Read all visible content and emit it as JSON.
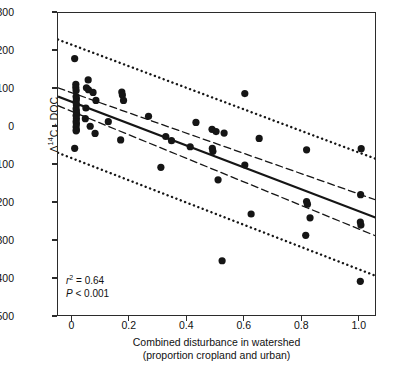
{
  "chart_data": {
    "type": "scatter",
    "title": "",
    "xlabel": "Combined disturbance in watershed (proportion cropland and urban)",
    "xlabel_line1": "Combined disturbance in watershed",
    "xlabel_line2": "(proportion cropland and urban)",
    "ylabel": "Δ14C - DOC",
    "ylabel_prefix": "Δ",
    "ylabel_sup": "14",
    "ylabel_suffix": "C - DOC",
    "xlim": [
      -0.05,
      1.06
    ],
    "ylim": [
      -500,
      300
    ],
    "xticks": [
      "0",
      "0.2",
      "0.4",
      "0.6",
      "0.8",
      "1.0"
    ],
    "xtick_values": [
      0,
      0.2,
      0.4,
      0.6,
      0.8,
      1.0
    ],
    "yticks": [
      "300",
      "200",
      "100",
      "0",
      "-100",
      "-200",
      "-300",
      "-400",
      "-500"
    ],
    "ytick_values": [
      300,
      200,
      100,
      0,
      -100,
      -200,
      -300,
      -400,
      -500
    ],
    "grid": false,
    "legend": "none",
    "marker_color": "#151515",
    "line_color": "#151515",
    "annotations": {
      "r_squared_label": "r",
      "r_squared_sup": "2",
      "r_squared_value": "= 0.64",
      "r_squared_text": "r2 = 0.64",
      "p_label": "P",
      "p_value": "< 0.001",
      "p_text": "P < 0.001"
    },
    "fit_line": {
      "name": "regression line",
      "style": "solid",
      "x": [
        -0.05,
        1.06
      ],
      "y": [
        80,
        -240
      ],
      "slope": -290,
      "intercept": 66
    },
    "confidence_band": {
      "name": "95% confidence interval",
      "style": "dashed",
      "upper": {
        "x": [
          -0.05,
          1.06
        ],
        "y": [
          103,
          -193
        ]
      },
      "lower": {
        "x": [
          -0.05,
          1.06
        ],
        "y": [
          56,
          -288
        ]
      }
    },
    "prediction_band": {
      "name": "95% prediction interval",
      "style": "dotted",
      "upper": {
        "x": [
          -0.05,
          1.06
        ],
        "y": [
          230,
          -85
        ]
      },
      "lower": {
        "x": [
          -0.05,
          1.06
        ],
        "y": [
          -68,
          -393
        ]
      }
    },
    "points": [
      {
        "x": 0.008,
        "y": 180
      },
      {
        "x": 0.055,
        "y": 124
      },
      {
        "x": 0.012,
        "y": 112
      },
      {
        "x": 0.012,
        "y": 104
      },
      {
        "x": 0.049,
        "y": 103
      },
      {
        "x": 0.056,
        "y": 98
      },
      {
        "x": 0.013,
        "y": 96
      },
      {
        "x": 0.072,
        "y": 91
      },
      {
        "x": 0.6,
        "y": 88
      },
      {
        "x": 0.172,
        "y": 92
      },
      {
        "x": 0.174,
        "y": 84
      },
      {
        "x": 0.013,
        "y": 80
      },
      {
        "x": 0.014,
        "y": 74
      },
      {
        "x": 0.082,
        "y": 70
      },
      {
        "x": 0.178,
        "y": 70
      },
      {
        "x": 0.013,
        "y": 66
      },
      {
        "x": 0.014,
        "y": 58
      },
      {
        "x": 0.047,
        "y": 50
      },
      {
        "x": 0.013,
        "y": 48
      },
      {
        "x": 0.014,
        "y": 42
      },
      {
        "x": 0.265,
        "y": 28
      },
      {
        "x": 0.015,
        "y": 34
      },
      {
        "x": 0.013,
        "y": 30
      },
      {
        "x": 0.045,
        "y": 22
      },
      {
        "x": 0.014,
        "y": 22
      },
      {
        "x": 0.125,
        "y": 14
      },
      {
        "x": 0.43,
        "y": 12
      },
      {
        "x": 0.013,
        "y": 14
      },
      {
        "x": 0.014,
        "y": 8
      },
      {
        "x": 0.062,
        "y": 2
      },
      {
        "x": 0.013,
        "y": 0
      },
      {
        "x": 0.486,
        "y": -6
      },
      {
        "x": 0.5,
        "y": -12
      },
      {
        "x": 0.014,
        "y": -8
      },
      {
        "x": 0.079,
        "y": -17
      },
      {
        "x": 0.528,
        "y": -16
      },
      {
        "x": 0.013,
        "y": -10
      },
      {
        "x": 0.325,
        "y": -25
      },
      {
        "x": 0.65,
        "y": -30
      },
      {
        "x": 0.168,
        "y": -34
      },
      {
        "x": 0.345,
        "y": -36
      },
      {
        "x": 0.41,
        "y": -52
      },
      {
        "x": 0.487,
        "y": -56
      },
      {
        "x": 0.489,
        "y": -64
      },
      {
        "x": 0.008,
        "y": -56
      },
      {
        "x": 0.815,
        "y": -60
      },
      {
        "x": 1.005,
        "y": -57
      },
      {
        "x": 0.6,
        "y": -100
      },
      {
        "x": 0.308,
        "y": -106
      },
      {
        "x": 0.507,
        "y": -139
      },
      {
        "x": 1.003,
        "y": -178
      },
      {
        "x": 0.815,
        "y": -196
      },
      {
        "x": 0.818,
        "y": -203
      },
      {
        "x": 0.622,
        "y": -229
      },
      {
        "x": 0.827,
        "y": -239
      },
      {
        "x": 1.002,
        "y": -250
      },
      {
        "x": 1.004,
        "y": -258
      },
      {
        "x": 0.812,
        "y": -285
      },
      {
        "x": 0.521,
        "y": -352
      },
      {
        "x": 1.002,
        "y": -406
      }
    ]
  }
}
